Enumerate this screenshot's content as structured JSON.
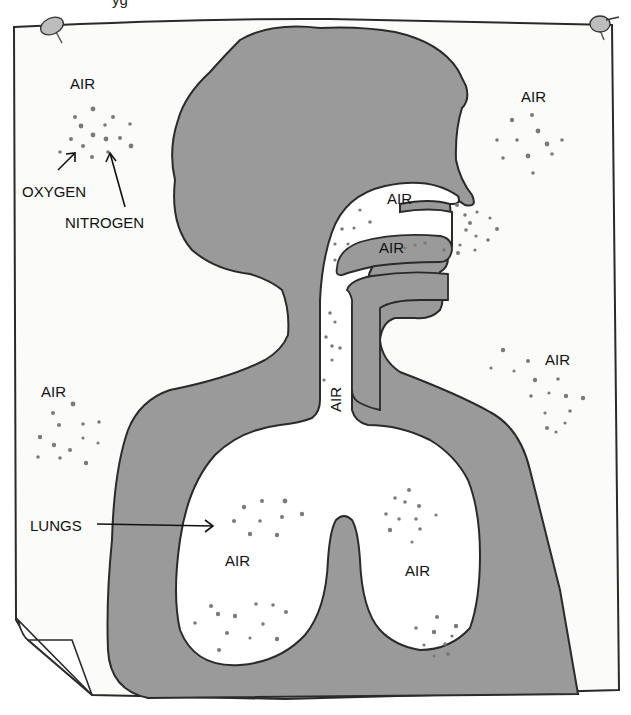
{
  "title_fragment": "yg",
  "colors": {
    "paper": "#fbfbfa",
    "wash": "#9a9a9a",
    "wash_dark": "#8c8c8c",
    "outline": "#2a2a2a",
    "dot": "#777777",
    "text": "#111111"
  },
  "labels": {
    "air_top_left": "AIR",
    "oxygen": "OXYGEN",
    "nitrogen": "NITROGEN",
    "air_top_right": "AIR",
    "air_nasal_upper": "AIR",
    "air_nasal_lower": "AIR",
    "air_trachea": "AIR",
    "air_right_mid": "AIR",
    "air_left_mid": "AIR",
    "lungs": "LUNGS",
    "air_lung_left": "AIR",
    "air_lung_right": "AIR"
  },
  "pins": [
    {
      "name": "pushpin-top-left"
    },
    {
      "name": "pushpin-top-right"
    }
  ]
}
